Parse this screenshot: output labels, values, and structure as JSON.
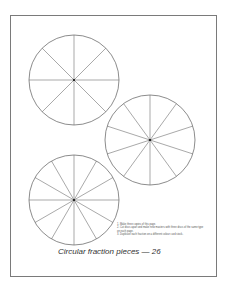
{
  "page": {
    "discs": [
      {
        "id": "eighths",
        "segments": 8,
        "cx": 74,
        "cy": 80,
        "r": 45
      },
      {
        "id": "tenths",
        "segments": 10,
        "cx": 150,
        "cy": 140,
        "r": 45
      },
      {
        "id": "twelfths",
        "segments": 12,
        "cx": 74,
        "cy": 200,
        "r": 45
      }
    ],
    "instructions": [
      "1. Make three copies of this page.",
      "2. Cut discs apart and make new masters with three discs of the same type on each page.",
      "3. Duplicate each fraction on a different colour card stock."
    ],
    "caption": "Circular fraction pieces — 26",
    "line_color": "#6e6e6e"
  }
}
